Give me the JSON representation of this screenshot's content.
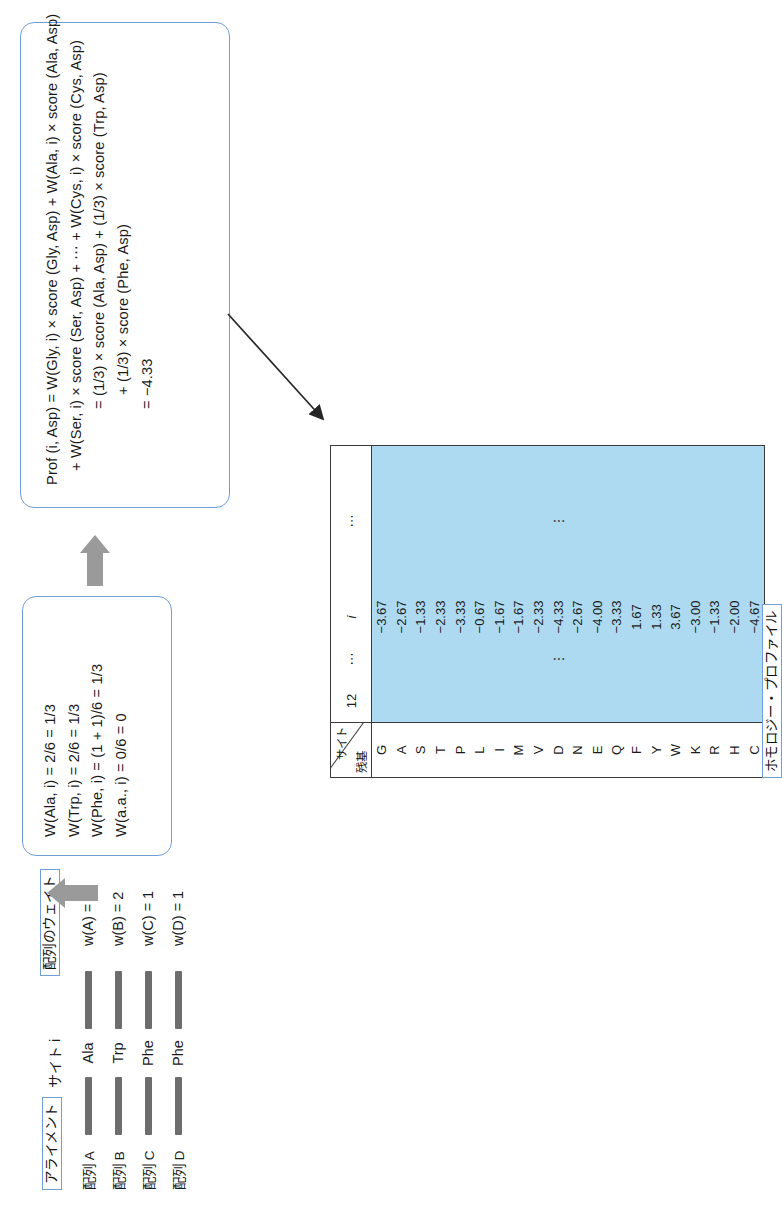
{
  "figure": {
    "orientation": "page rotated 90 degrees counter-clockwise",
    "labels": {
      "alignment": "アライメント",
      "site_i": "サイト i",
      "sequence_weights": "配列のウェイト",
      "homology_profile": "ホモロジー・プロファイル"
    }
  },
  "alignment": {
    "rows": [
      {
        "name": "配列 A",
        "residue": "Ala",
        "weight_label": "w(A) = 2"
      },
      {
        "name": "配列 B",
        "residue": "Trp",
        "weight_label": "w(B) = 2"
      },
      {
        "name": "配列 C",
        "residue": "Phe",
        "weight_label": "w(C) = 1"
      },
      {
        "name": "配列 D",
        "residue": "Phe",
        "weight_label": "w(D) = 1"
      }
    ]
  },
  "weight_box": {
    "lines": [
      "W(Ala, i)  =  2/6  =  1/3",
      "W(Trp, i)  =  2/6  =  1/3",
      "W(Phe, i)  =  (1 + 1)/6  =  1/3",
      "W(a.a., i)  =  0/6  =  0"
    ]
  },
  "profile_box": {
    "lines": [
      "Prof (i, Asp)  =  W(Gly, i)  ×  score (Gly, Asp)  +  W(Ala, i)  ×  score (Ala, Asp)",
      "+ W(Ser, i)  ×  score (Ser, Asp)  + ⋯ +  W(Cys, i)  ×  score (Cys, Asp)",
      "=  (1/3)  ×  score (Ala, Asp)  +  (1/3)  ×  score (Trp, Asp)",
      "+  (1/3)  ×  score (Phe, Asp)",
      "=  −4.33"
    ]
  },
  "arrows": {
    "gray_arrow_1": "weight-box-to-profile-box",
    "black_arrow_1": "profile-box-to-table-column"
  },
  "chart_data": {
    "type": "table",
    "title": "ホモロジー・プロファイル",
    "corner_row_label": "残基",
    "corner_col_label": "サイト",
    "columns": [
      "12",
      "⋯",
      "i",
      "⋯"
    ],
    "categories": [
      "G",
      "A",
      "S",
      "T",
      "P",
      "L",
      "I",
      "M",
      "V",
      "D",
      "N",
      "E",
      "Q",
      "F",
      "Y",
      "W",
      "K",
      "R",
      "H",
      "C"
    ],
    "column_i_values": [
      -3.67,
      -2.67,
      -1.33,
      -2.33,
      -3.33,
      -0.67,
      -1.67,
      -1.67,
      -2.33,
      -4.33,
      -2.67,
      -4.0,
      -3.33,
      1.67,
      1.33,
      3.67,
      -3.0,
      -1.33,
      -2.0,
      -4.67
    ],
    "column_i_display": [
      "−3.67",
      "−2.67",
      "−1.33",
      "−2.33",
      "−3.33",
      "−0.67",
      "−1.67",
      "−1.67",
      "−2.33",
      "−4.33",
      "−2.67",
      "−4.00",
      "−3.33",
      "1.67",
      "1.33",
      "3.67",
      "−3.00",
      "−1.33",
      "−2.00",
      "−4.67"
    ],
    "ellipsis_glyph": "⋮",
    "highlight_color": "#addaf0",
    "border_color": "#3a3a3a"
  }
}
